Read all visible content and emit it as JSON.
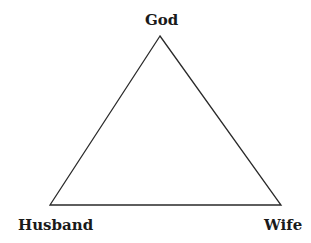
{
  "diagram": {
    "type": "triangle",
    "stroke_color": "#2a2a2a",
    "background": "#ffffff",
    "vertices": {
      "top": {
        "label": "God",
        "x": 160,
        "y": 36
      },
      "bottom_left": {
        "label": "Husband",
        "x": 50,
        "y": 205
      },
      "bottom_right": {
        "label": "Wife",
        "x": 281,
        "y": 205
      }
    },
    "labels": {
      "top": "God",
      "bottom_left": "Husband",
      "bottom_right": "Wife"
    }
  }
}
